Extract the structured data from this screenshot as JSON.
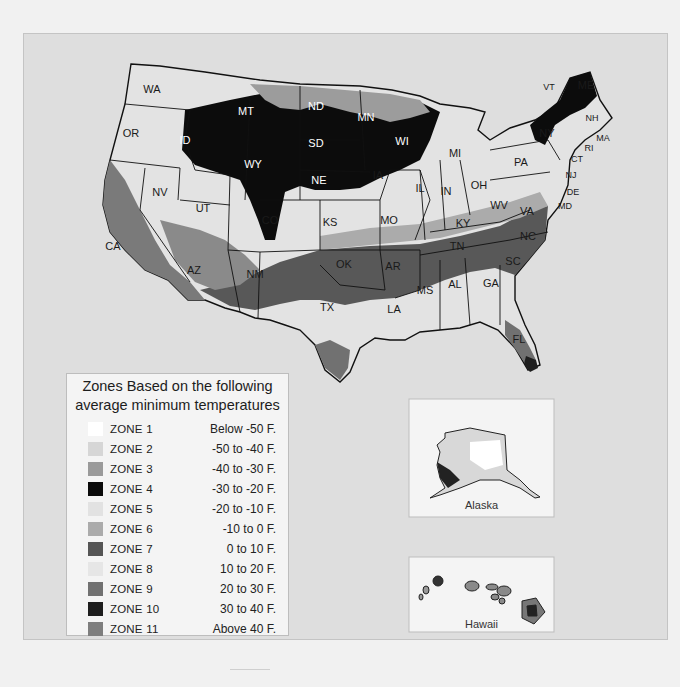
{
  "legend": {
    "title_line1": "Zones Based on the following",
    "title_line2": "average minimum temperatures",
    "zones": [
      {
        "name": "ZONE 1",
        "range": "Below -50 F.",
        "color": "#ffffff"
      },
      {
        "name": "ZONE 2",
        "range": "-50 to -40 F.",
        "color": "#d6d6d6"
      },
      {
        "name": "ZONE 3",
        "range": "-40 to -30 F.",
        "color": "#9a9a9a"
      },
      {
        "name": "ZONE 4",
        "range": "-30 to -20 F.",
        "color": "#0a0a0a"
      },
      {
        "name": "ZONE 5",
        "range": "-20 to -10 F.",
        "color": "#e2e2e2"
      },
      {
        "name": "ZONE 6",
        "range": "-10 to 0 F.",
        "color": "#ababab"
      },
      {
        "name": "ZONE 7",
        "range": "0 to 10 F.",
        "color": "#555555"
      },
      {
        "name": "ZONE 8",
        "range": "10 to 20 F.",
        "color": "#e6e6e6"
      },
      {
        "name": "ZONE 9",
        "range": "20 to 30 F.",
        "color": "#717171"
      },
      {
        "name": "ZONE 10",
        "range": "30 to 40 F.",
        "color": "#1e1e1e"
      },
      {
        "name": "ZONE 11",
        "range": "Above 40 F.",
        "color": "#7e7e7e"
      }
    ]
  },
  "insets": {
    "alaska": {
      "label": "Alaska"
    },
    "hawaii": {
      "label": "Hawaii"
    }
  },
  "states": [
    {
      "abbr": "WA",
      "x": 152,
      "y": 93,
      "light": false
    },
    {
      "abbr": "OR",
      "x": 131,
      "y": 137,
      "light": false
    },
    {
      "abbr": "CA",
      "x": 113,
      "y": 250,
      "light": false
    },
    {
      "abbr": "NV",
      "x": 160,
      "y": 196,
      "light": false
    },
    {
      "abbr": "ID",
      "x": 185,
      "y": 144,
      "light": true
    },
    {
      "abbr": "MT",
      "x": 246,
      "y": 115,
      "light": true
    },
    {
      "abbr": "WY",
      "x": 253,
      "y": 168,
      "light": true
    },
    {
      "abbr": "UT",
      "x": 203,
      "y": 212,
      "light": false
    },
    {
      "abbr": "CO",
      "x": 270,
      "y": 224,
      "light": false
    },
    {
      "abbr": "AZ",
      "x": 194,
      "y": 274,
      "light": false
    },
    {
      "abbr": "NM",
      "x": 255,
      "y": 278,
      "light": false
    },
    {
      "abbr": "ND",
      "x": 316,
      "y": 110,
      "light": true
    },
    {
      "abbr": "SD",
      "x": 316,
      "y": 147,
      "light": true
    },
    {
      "abbr": "NE",
      "x": 319,
      "y": 184,
      "light": true
    },
    {
      "abbr": "KS",
      "x": 330,
      "y": 226,
      "light": false
    },
    {
      "abbr": "OK",
      "x": 344,
      "y": 268,
      "light": false
    },
    {
      "abbr": "TX",
      "x": 327,
      "y": 311,
      "light": false
    },
    {
      "abbr": "MN",
      "x": 366,
      "y": 121,
      "light": true
    },
    {
      "abbr": "WI",
      "x": 402,
      "y": 145,
      "light": true
    },
    {
      "abbr": "IA",
      "x": 378,
      "y": 179,
      "light": false
    },
    {
      "abbr": "MO",
      "x": 389,
      "y": 224,
      "light": false
    },
    {
      "abbr": "AR",
      "x": 393,
      "y": 270,
      "light": false
    },
    {
      "abbr": "LA",
      "x": 394,
      "y": 313,
      "light": false
    },
    {
      "abbr": "IL",
      "x": 420,
      "y": 192,
      "light": false
    },
    {
      "abbr": "MI",
      "x": 455,
      "y": 157,
      "light": false
    },
    {
      "abbr": "IN",
      "x": 446,
      "y": 195,
      "light": false
    },
    {
      "abbr": "OH",
      "x": 479,
      "y": 189,
      "light": false
    },
    {
      "abbr": "KY",
      "x": 463,
      "y": 227,
      "light": false
    },
    {
      "abbr": "TN",
      "x": 457,
      "y": 250,
      "light": false
    },
    {
      "abbr": "MS",
      "x": 425,
      "y": 294,
      "light": false
    },
    {
      "abbr": "AL",
      "x": 455,
      "y": 288,
      "light": false
    },
    {
      "abbr": "GA",
      "x": 491,
      "y": 287,
      "light": false
    },
    {
      "abbr": "FL",
      "x": 519,
      "y": 343,
      "light": false
    },
    {
      "abbr": "SC",
      "x": 513,
      "y": 265,
      "light": false
    },
    {
      "abbr": "NC",
      "x": 528,
      "y": 240,
      "light": false
    },
    {
      "abbr": "VA",
      "x": 527,
      "y": 215,
      "light": false
    },
    {
      "abbr": "WV",
      "x": 499,
      "y": 209,
      "light": false
    },
    {
      "abbr": "PA",
      "x": 521,
      "y": 166,
      "light": false
    },
    {
      "abbr": "NY",
      "x": 547,
      "y": 137,
      "light": false
    },
    {
      "abbr": "VT",
      "x": 549,
      "y": 90,
      "light": false
    },
    {
      "abbr": "ME",
      "x": 586,
      "y": 89,
      "light": false
    },
    {
      "abbr": "NH",
      "x": 592,
      "y": 121,
      "light": false
    },
    {
      "abbr": "MA",
      "x": 603,
      "y": 141,
      "light": false
    },
    {
      "abbr": "RI",
      "x": 589,
      "y": 151,
      "light": false
    },
    {
      "abbr": "CT",
      "x": 577,
      "y": 162,
      "light": false
    },
    {
      "abbr": "NJ",
      "x": 571,
      "y": 178,
      "light": false
    },
    {
      "abbr": "DE",
      "x": 573,
      "y": 195,
      "light": false
    },
    {
      "abbr": "MD",
      "x": 565,
      "y": 209,
      "light": false
    }
  ]
}
